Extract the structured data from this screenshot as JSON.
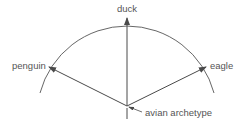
{
  "diagram": {
    "labels": {
      "top": "duck",
      "left": "penguin",
      "right": "eagle",
      "origin": "avian archetype"
    },
    "colors": {
      "stroke": "#4a4a4a",
      "text": "#555555",
      "background": "#ffffff"
    }
  }
}
